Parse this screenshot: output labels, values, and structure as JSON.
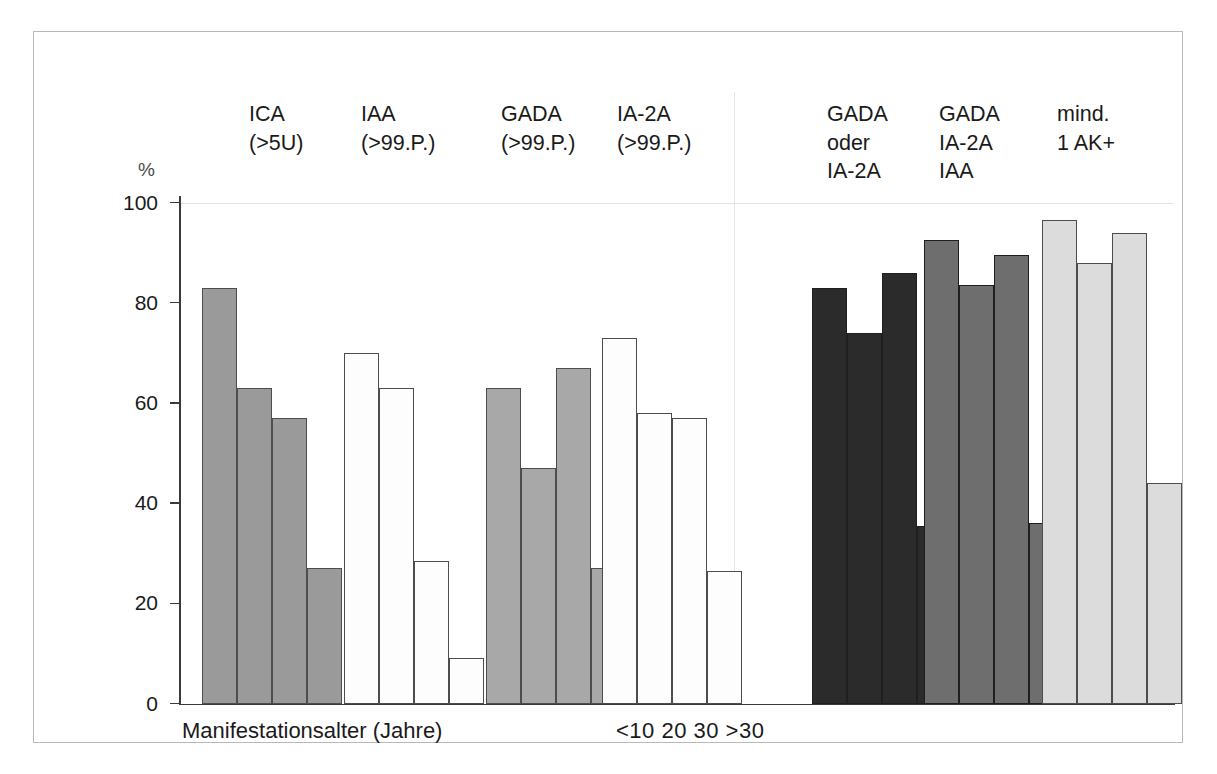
{
  "figure": {
    "axis_unit": "%",
    "x_caption_main": "Manifestationsalter (Jahre)",
    "x_caption_classes": "<10 20 30 >30"
  },
  "chart_data": {
    "type": "bar",
    "title": "",
    "xlabel": "Manifestationsalter (Jahre)",
    "ylabel": "%",
    "ylim": [
      0,
      100
    ],
    "yticks": [
      0,
      20,
      40,
      60,
      80,
      100
    ],
    "ytick_labels": [
      "0",
      "20",
      "40",
      "60",
      "80",
      "100"
    ],
    "grid": "horizontal gridline at 100 only",
    "legend": "none (group headers above bars)",
    "categories": [
      "<10",
      "20",
      "30",
      ">30"
    ],
    "category_caption": "<10 20 30 >30",
    "panels": [
      {
        "name": "Einzelantikörper",
        "groups": [
          0,
          1,
          2,
          3
        ]
      },
      {
        "name": "Kombinationen",
        "groups": [
          4,
          5,
          6
        ]
      }
    ],
    "series": [
      {
        "name": "ICA (>5U)",
        "label_lines": [
          "ICA",
          "(>5U)"
        ],
        "fill": "#9a9a9a",
        "values": [
          83,
          63,
          57,
          27
        ]
      },
      {
        "name": "IAA (>99.P.)",
        "label_lines": [
          "IAA",
          "(>99.P.)"
        ],
        "fill": "#fdfdfd",
        "values": [
          70,
          63,
          28.5,
          9
        ]
      },
      {
        "name": "GADA (>99.P.)",
        "label_lines": [
          "GADA",
          "(>99.P.)"
        ],
        "fill": "#a8a8a8",
        "values": [
          63,
          47,
          67,
          27
        ]
      },
      {
        "name": "IA-2A (>99.P.)",
        "label_lines": [
          "IA-2A",
          "(>99.P.)"
        ],
        "fill": "#fdfdfd",
        "values": [
          73,
          58,
          57,
          26.5
        ]
      },
      {
        "name": "GADA oder IA-2A",
        "label_lines": [
          "GADA",
          "oder",
          "IA-2A"
        ],
        "fill": "#2b2b2b",
        "values": [
          83,
          74,
          86,
          35.5
        ]
      },
      {
        "name": "GADA IA-2A IAA",
        "label_lines": [
          "GADA",
          "IA-2A",
          "IAA"
        ],
        "fill": "#6e6e6e",
        "values": [
          92.5,
          83.5,
          89.5,
          36
        ]
      },
      {
        "name": "mind. 1 AK+",
        "label_lines": [
          "mind.",
          "1 AK+"
        ],
        "fill": "#dcdcdc",
        "values": [
          96.5,
          88,
          94,
          44
        ]
      }
    ]
  }
}
